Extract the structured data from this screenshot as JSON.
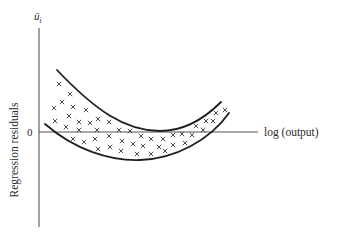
{
  "figure": {
    "y_axis_symbol": "û",
    "y_axis_symbol_subscript": "i",
    "y_axis_label": "Regression residuals",
    "x_axis_label": "log (output)",
    "zero_label": "0"
  },
  "geometry": {
    "origin": {
      "x": 39,
      "y": 132
    },
    "y_axis": {
      "x": 39,
      "y_top": 28,
      "y_bottom": 227
    },
    "x_axis": {
      "y": 132,
      "x_start": 39,
      "x_end": 258
    },
    "upper_bound_curve": "M57,70 C95,110 125,131 160,131 C185,131 205,118 221,102",
    "lower_bound_curve": "M45,124 C75,150 110,161 140,160 C175,159 210,140 229,113"
  },
  "scatter_points": [
    [
      59,
      84
    ],
    [
      70,
      94
    ],
    [
      62,
      102
    ],
    [
      54,
      108
    ],
    [
      73,
      107
    ],
    [
      86,
      110
    ],
    [
      69,
      116
    ],
    [
      55,
      121
    ],
    [
      79,
      122
    ],
    [
      90,
      123
    ],
    [
      98,
      119
    ],
    [
      109,
      122
    ],
    [
      66,
      127
    ],
    [
      79,
      130
    ],
    [
      97,
      130
    ],
    [
      119,
      130
    ],
    [
      130,
      131
    ],
    [
      73,
      139
    ],
    [
      84,
      142
    ],
    [
      95,
      139
    ],
    [
      109,
      136
    ],
    [
      122,
      141
    ],
    [
      98,
      149
    ],
    [
      110,
      147
    ],
    [
      121,
      151
    ],
    [
      133,
      144
    ],
    [
      141,
      136
    ],
    [
      143,
      146
    ],
    [
      137,
      154
    ],
    [
      151,
      139
    ],
    [
      151,
      154
    ],
    [
      159,
      147
    ],
    [
      163,
      139
    ],
    [
      165,
      151
    ],
    [
      173,
      135
    ],
    [
      173,
      145
    ],
    [
      182,
      134
    ],
    [
      185,
      143
    ],
    [
      192,
      135
    ],
    [
      196,
      126
    ],
    [
      203,
      130
    ],
    [
      206,
      121
    ],
    [
      213,
      121
    ],
    [
      216,
      113
    ],
    [
      225,
      110
    ]
  ],
  "colors": {
    "curve": "#1e1e1e",
    "axis": "#555555",
    "cross": "#3a3a3a",
    "text": "#2a2a2a",
    "background": "#ffffff"
  }
}
